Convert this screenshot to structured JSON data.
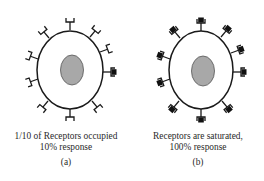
{
  "figure": {
    "panels": [
      {
        "id": "a",
        "caption_line1": "1/10 of Receptors occupied",
        "caption_line2": "10% response",
        "label": "(a)",
        "receptors_total": 10,
        "receptors_occupied": 1
      },
      {
        "id": "b",
        "caption_line1": "Receptors are saturated,",
        "caption_line2": "100% response",
        "label": "(b)",
        "receptors_total": 10,
        "receptors_occupied": 10
      }
    ],
    "colors": {
      "outline": "#1a1a1a",
      "cell_fill": "#ffffff",
      "nucleus_fill": "#a8a8a8",
      "ligand_fill": "#111111"
    },
    "icons": {
      "receptor": "cup-receptor-icon",
      "ligand": "square-ligand-icon",
      "nucleus": "nucleus-icon"
    }
  }
}
